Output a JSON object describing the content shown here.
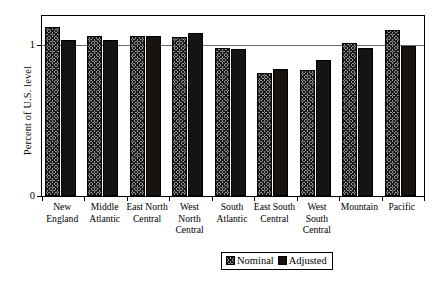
{
  "chart_data": {
    "type": "bar",
    "title": "",
    "subtitle": "",
    "xlabel": "",
    "ylabel": "Percent of U.S. level",
    "ylim": [
      0,
      1.19
    ],
    "yticks": [
      0,
      1
    ],
    "ytick_labels": [
      "0",
      "1"
    ],
    "grid": true,
    "grid_axis": "y",
    "legend_position": "bottom-right",
    "categories": [
      "New England",
      "Middle Atlantic",
      "East North Central",
      "West North Central",
      "South Atlantic",
      "East South Central",
      "West South Central",
      "Mountain",
      "Pacific"
    ],
    "category_lines": [
      [
        "New",
        "England"
      ],
      [
        "Middle",
        "Atlantic"
      ],
      [
        "East North",
        "Central"
      ],
      [
        "West",
        "North",
        "Central"
      ],
      [
        "South",
        "Atlantic"
      ],
      [
        "East South",
        "Central"
      ],
      [
        "West",
        "South",
        "Central"
      ],
      [
        "Mountain"
      ],
      [
        "Pacific"
      ]
    ],
    "series": [
      {
        "name": "Nominal",
        "color": "#8f8f8f",
        "pattern": "crosshatch",
        "values": [
          1.12,
          1.06,
          1.06,
          1.05,
          0.98,
          0.81,
          0.83,
          1.01,
          1.1
        ]
      },
      {
        "name": "Adjusted",
        "color": "#171310",
        "pattern": "solid",
        "values": [
          1.03,
          1.03,
          1.06,
          1.08,
          0.97,
          0.84,
          0.9,
          0.98,
          0.99
        ]
      }
    ]
  },
  "legend": {
    "entries": [
      {
        "label": "Nominal"
      },
      {
        "label": "Adjusted"
      }
    ]
  }
}
